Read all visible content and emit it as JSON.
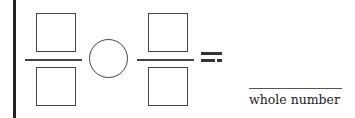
{
  "worksheet": {
    "expression": {
      "left_fraction": {
        "numerator": "",
        "denominator": ""
      },
      "operator": "",
      "right_fraction": {
        "numerator": "",
        "denominator": ""
      },
      "equals_symbol": "="
    },
    "answer": {
      "value": "",
      "label": "whole number"
    }
  }
}
